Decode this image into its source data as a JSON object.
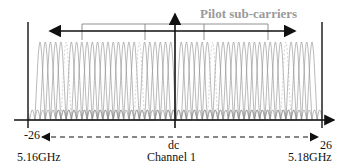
{
  "diagram": {
    "title_label": "Pilot sub-carriers",
    "left_index": "-26",
    "right_index": "26",
    "center_label": "dc",
    "channel_label": "Channel 1",
    "left_freq": "5.16GHz",
    "right_freq": "5.18GHz",
    "subcarrier_range": {
      "min": -26,
      "max": 26
    },
    "pilot_positions": [
      -21,
      -7,
      7,
      21
    ],
    "colors": {
      "axis": "#111111",
      "subcarrier": "#8c8c8c",
      "pilot_label": "#9a9a9a",
      "background": "#ffffff"
    }
  }
}
